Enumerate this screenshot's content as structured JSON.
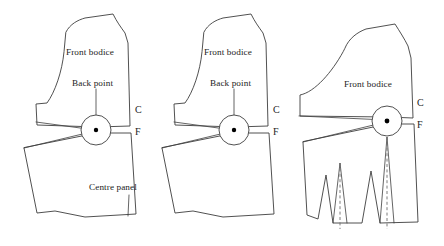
{
  "figure": {
    "background_color": "#ffffff",
    "line_color": "#3d3d3d",
    "dart_center_color": "#6d6d6d",
    "dot_color": "#000000"
  },
  "panels": [
    {
      "id": "panel-1",
      "labels": {
        "front_bodice": "Front bodice",
        "back_point": "Back point",
        "centre_front_top": "C",
        "centre_front_bottom": "F",
        "centre_panel": "Centre panel"
      },
      "bust_point": {
        "cx": 96,
        "cy": 130,
        "r": 15,
        "dot_r": 2.2
      },
      "has_darts": false,
      "has_centre_panel_label": true,
      "has_back_point_label": true
    },
    {
      "id": "panel-2",
      "labels": {
        "front_bodice": "Front bodice",
        "back_point": "Back point",
        "centre_front_top": "C",
        "centre_front_bottom": "F"
      },
      "bust_point": {
        "cx": 234,
        "cy": 130,
        "r": 15,
        "dot_r": 2.2
      },
      "has_darts": false,
      "has_centre_panel_label": false,
      "has_back_point_label": true
    },
    {
      "id": "panel-3",
      "labels": {
        "front_bodice": "Front bodice",
        "centre_front_top": "C",
        "centre_front_bottom": "F"
      },
      "bust_point": {
        "cx": 387,
        "cy": 121,
        "r": 15,
        "dot_r": 2.4
      },
      "has_darts": true,
      "dart_count": 2,
      "has_centre_panel_label": false,
      "has_back_point_label": false
    }
  ],
  "icons": {
    "bust_point_circle": "bust-point-circle-icon",
    "bust_point_dot": "bust-point-dot-icon",
    "dart_dashed_line": "dart-foldline-icon",
    "leader_line": "leader-line-icon"
  }
}
